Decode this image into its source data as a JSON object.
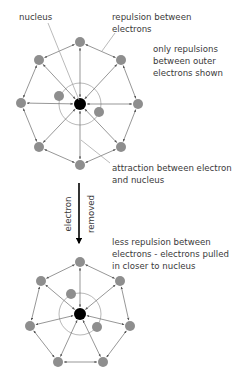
{
  "labels": {
    "nucleus": "nucleus",
    "repulsion_1": "repulsion between",
    "repulsion_2": "electrons",
    "only_1": "only repulsions",
    "only_2": "between outer",
    "only_3": "electrons shown",
    "attraction_1": "attraction between electron",
    "attraction_2": "and nucleus",
    "arrow_left": "electron",
    "arrow_right": "removed",
    "less_1": "less repulsion between",
    "less_2": "electrons - electrons pulled",
    "less_3": "in closer to nucleus"
  },
  "colors": {
    "electron": "#8e8e8e",
    "nucleus": "#000000",
    "line": "#6a6a6a",
    "leader": "#a8a8a8",
    "text": "#3a3a3a"
  },
  "diagrams": {
    "before": {
      "nucleus": [
        80,
        104
      ],
      "inner_circle_radius": 21,
      "outer_electrons": [
        [
          80,
          42
        ],
        [
          121,
          60
        ],
        [
          138,
          104
        ],
        [
          121,
          147
        ],
        [
          80,
          165
        ],
        [
          39,
          147
        ],
        [
          21,
          103
        ],
        [
          39,
          60
        ]
      ],
      "inner_electrons": [
        [
          59,
          96
        ],
        [
          99,
          112
        ]
      ]
    },
    "after": {
      "nucleus": [
        80,
        314
      ],
      "inner_circle_radius": 21,
      "outer_electrons": [
        [
          80,
          262
        ],
        [
          120,
          281
        ],
        [
          130,
          326
        ],
        [
          103,
          362
        ],
        [
          58,
          362
        ],
        [
          30,
          326
        ],
        [
          41,
          281
        ]
      ],
      "inner_electrons": [
        [
          71,
          294
        ],
        [
          97,
          327
        ]
      ]
    }
  }
}
